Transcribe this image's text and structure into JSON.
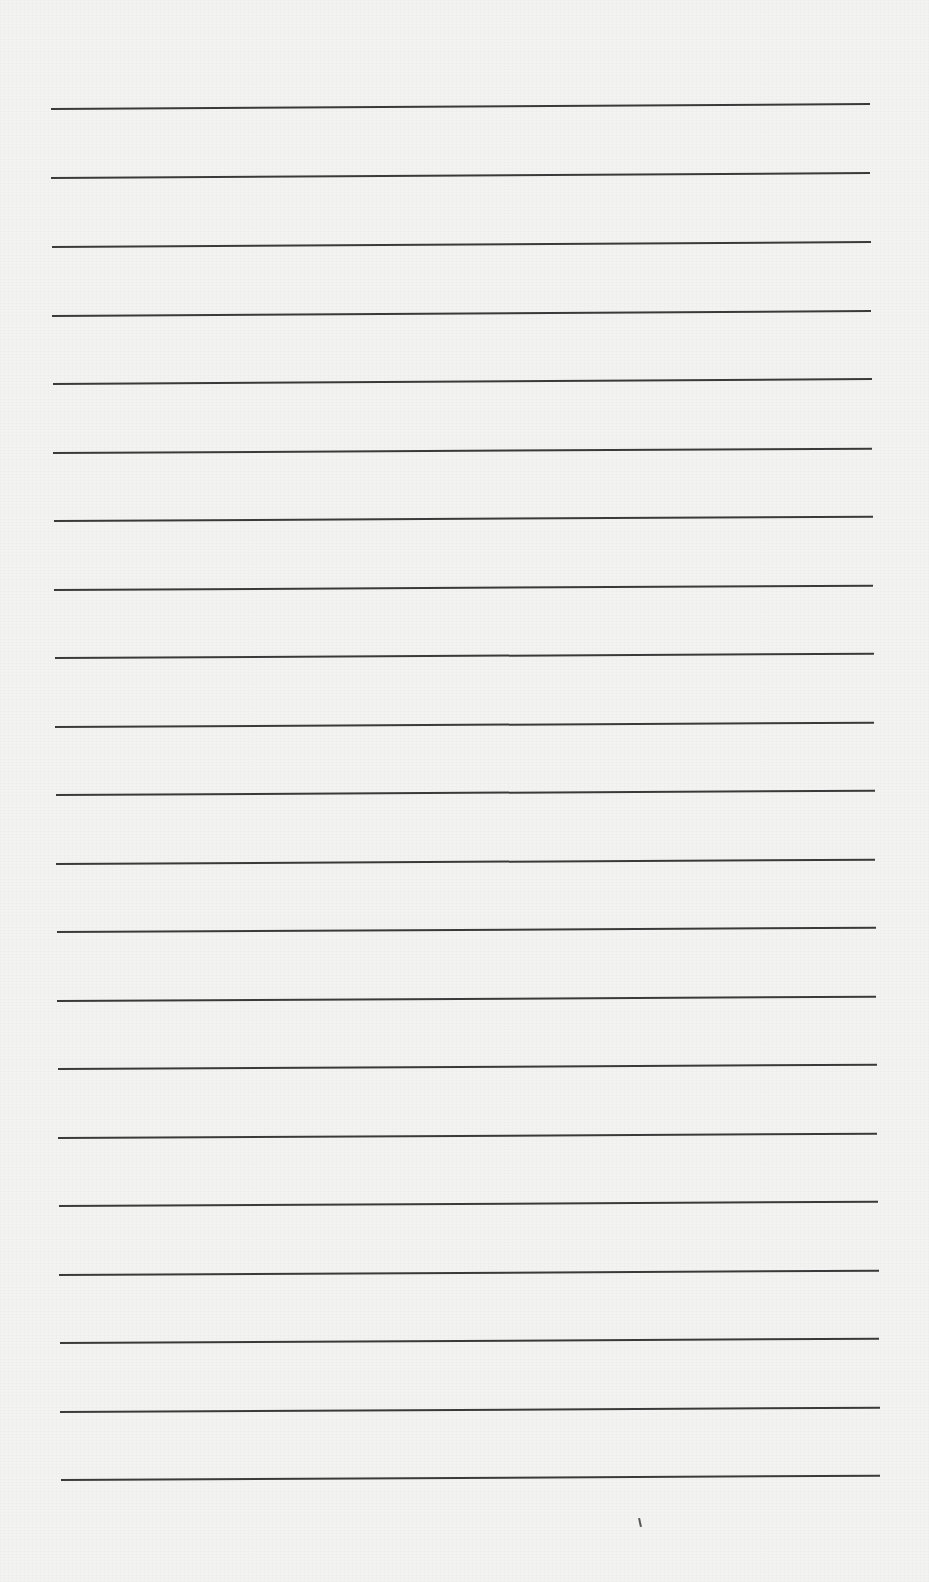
{
  "document": {
    "type": "ruled-paper",
    "line_count": 21,
    "line_color": "#3a3a3a",
    "paper_color": "#f3f3f1",
    "lines": [
      {
        "y": 108,
        "x1": 51,
        "x2": 870,
        "tilt": -0.35
      },
      {
        "y": 177,
        "x1": 51,
        "x2": 870,
        "tilt": -0.35
      },
      {
        "y": 246,
        "x1": 52,
        "x2": 871,
        "tilt": -0.35
      },
      {
        "y": 315,
        "x1": 52,
        "x2": 871,
        "tilt": -0.35
      },
      {
        "y": 383,
        "x1": 53,
        "x2": 872,
        "tilt": -0.35
      },
      {
        "y": 452,
        "x1": 53,
        "x2": 872,
        "tilt": -0.3
      },
      {
        "y": 520,
        "x1": 54,
        "x2": 873,
        "tilt": -0.3
      },
      {
        "y": 589,
        "x1": 54,
        "x2": 873,
        "tilt": -0.3
      },
      {
        "y": 657,
        "x1": 55,
        "x2": 874,
        "tilt": -0.3
      },
      {
        "y": 726,
        "x1": 55,
        "x2": 874,
        "tilt": -0.3
      },
      {
        "y": 794,
        "x1": 56,
        "x2": 875,
        "tilt": -0.3
      },
      {
        "y": 863,
        "x1": 56,
        "x2": 875,
        "tilt": -0.3
      },
      {
        "y": 931,
        "x1": 57,
        "x2": 876,
        "tilt": -0.3
      },
      {
        "y": 1000,
        "x1": 57,
        "x2": 876,
        "tilt": -0.3
      },
      {
        "y": 1068,
        "x1": 58,
        "x2": 877,
        "tilt": -0.3
      },
      {
        "y": 1137,
        "x1": 58,
        "x2": 877,
        "tilt": -0.3
      },
      {
        "y": 1205,
        "x1": 59,
        "x2": 878,
        "tilt": -0.3
      },
      {
        "y": 1274,
        "x1": 59,
        "x2": 879,
        "tilt": -0.3
      },
      {
        "y": 1342,
        "x1": 60,
        "x2": 879,
        "tilt": -0.3
      },
      {
        "y": 1411,
        "x1": 60,
        "x2": 880,
        "tilt": -0.3
      },
      {
        "y": 1479,
        "x1": 61,
        "x2": 880,
        "tilt": -0.3
      }
    ],
    "marks": [
      {
        "x": 639,
        "y": 1518
      }
    ]
  }
}
